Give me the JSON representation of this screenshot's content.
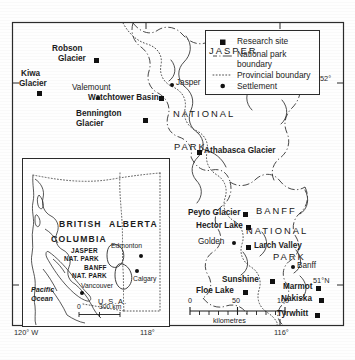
{
  "map": {
    "title": "Canadian Rockies research sites",
    "frame": {
      "left": 12,
      "top": 22,
      "right": 344,
      "bottom": 326
    },
    "colors": {
      "ink": "#1a1a1a",
      "paper": "#fefefe",
      "boundary": "#333333",
      "marker": "#111111"
    }
  },
  "legend": {
    "items": [
      {
        "symbol": "filled-square",
        "label": "Research site"
      },
      {
        "symbol": "dash-dot-line",
        "label": "National park\nboundary",
        "label_line1": "National park",
        "label_line2": "boundary"
      },
      {
        "symbol": "dotted-line",
        "label": "Provincial boundary"
      },
      {
        "symbol": "filled-circle",
        "label": "Settlement"
      }
    ]
  },
  "research_sites": [
    {
      "name": "Robson Glacier",
      "x": 96,
      "y": 60,
      "label_x": 50,
      "label_y": 48,
      "label_lines": [
        "Robson",
        "Glacier"
      ],
      "align": "right"
    },
    {
      "name": "Kiwa Glacier",
      "x": 39,
      "y": 93,
      "label_x": 20,
      "label_y": 74,
      "label_lines": [
        "Kiwa",
        "Glacier"
      ],
      "align": "left"
    },
    {
      "name": "Watchtower Basin",
      "x": 161,
      "y": 98,
      "label_x": 91,
      "label_y": 94,
      "label_lines": [
        "Watchtower Basin"
      ],
      "align": "left"
    },
    {
      "name": "Bennington Glacier",
      "x": 145,
      "y": 120,
      "label_x": 78,
      "label_y": 114,
      "label_lines": [
        "Bennington",
        "Glacier"
      ],
      "align": "left"
    },
    {
      "name": "Athabasca Glacier",
      "x": 199,
      "y": 152,
      "label_x": 205,
      "label_y": 144,
      "label_lines": [
        "Athabasca Glacier"
      ],
      "align": "left"
    },
    {
      "name": "Peyto Glacier",
      "x": 245,
      "y": 214,
      "label_x": 188,
      "label_y": 210,
      "label_lines": [
        "Peyto Glacier"
      ],
      "align": "left"
    },
    {
      "name": "Hector Lake",
      "x": 248,
      "y": 227,
      "label_x": 196,
      "label_y": 223,
      "label_lines": [
        "Hector Lake"
      ],
      "align": "left"
    },
    {
      "name": "Larch Valley",
      "x": 248,
      "y": 247,
      "label_x": 255,
      "label_y": 243,
      "label_lines": [
        "Larch Valley"
      ],
      "align": "left"
    },
    {
      "name": "Sunshine",
      "x": 272,
      "y": 281,
      "label_x": 222,
      "label_y": 277,
      "label_lines": [
        "Sunshine"
      ],
      "align": "left"
    },
    {
      "name": "Floe Lake",
      "x": 245,
      "y": 292,
      "label_x": 196,
      "label_y": 288,
      "label_lines": [
        "Floe Lake"
      ],
      "align": "left"
    },
    {
      "name": "Marmot",
      "x": 318,
      "y": 288,
      "label_x": 283,
      "label_y": 284,
      "label_lines": [
        "Marmot"
      ],
      "align": "left"
    },
    {
      "name": "Nakiska",
      "x": 321,
      "y": 300,
      "label_x": 283,
      "label_y": 296,
      "label_lines": [
        "Nakiska"
      ],
      "align": "left"
    },
    {
      "name": "Tyrwhitt",
      "x": 317,
      "y": 315,
      "label_x": 277,
      "label_y": 311,
      "label_lines": [
        "Tyrwhitt"
      ],
      "align": "left"
    }
  ],
  "settlements": [
    {
      "name": "Valemount",
      "x": 98,
      "y": 98,
      "label_x": 73,
      "label_y": 86
    },
    {
      "name": "Jasper",
      "x": 172,
      "y": 85,
      "label_x": 178,
      "label_y": 79
    },
    {
      "name": "Golden",
      "x": 234,
      "y": 243,
      "label_x": 198,
      "label_y": 239
    },
    {
      "name": "Banff",
      "x": 293,
      "y": 267,
      "label_x": 298,
      "label_y": 265
    }
  ],
  "park_words": [
    {
      "text": "JASPER",
      "x": 209,
      "y": 50
    },
    {
      "text": "NATIONAL",
      "x": 175,
      "y": 113
    },
    {
      "text": "PARK",
      "x": 176,
      "y": 146
    },
    {
      "text": "BANFF",
      "x": 256,
      "y": 210
    },
    {
      "text": "NATIONAL",
      "x": 248,
      "y": 230
    },
    {
      "text": "PARK",
      "x": 275,
      "y": 256
    }
  ],
  "graticule_labels": {
    "right": [
      {
        "text": "52°",
        "x": 321,
        "y": 77
      },
      {
        "text": "51°N",
        "x": 316,
        "y": 279
      }
    ],
    "bottom": [
      {
        "text": "120° W",
        "x": 14,
        "y": 330
      },
      {
        "text": "118°",
        "x": 143,
        "y": 330
      },
      {
        "text": "116°",
        "x": 278,
        "y": 330
      }
    ]
  },
  "scale_bar": {
    "ticks": [
      "0",
      "50",
      "100"
    ],
    "caption": "kilometres",
    "x": 190,
    "y": 306,
    "width": 95
  },
  "inset": {
    "box": {
      "left": 22,
      "top": 158,
      "width": 146,
      "height": 167
    },
    "provinces": [
      {
        "text": "BRITISH",
        "x": 58,
        "y": 225
      },
      {
        "text": "COLUMBIA",
        "x": 50,
        "y": 240
      },
      {
        "text": "ALBERTA",
        "x": 108,
        "y": 225
      }
    ],
    "parks": [
      {
        "lines": [
          "JASPER",
          "NAT. PARK"
        ],
        "x": 70,
        "y": 252
      },
      {
        "lines": [
          "BANFF",
          "NAT. PARK"
        ],
        "x": 83,
        "y": 272
      }
    ],
    "cities": [
      {
        "name": "Edmonton",
        "x": 138,
        "y": 255,
        "label_x": 110,
        "label_y": 245
      },
      {
        "name": "Calgary",
        "x": 133,
        "y": 276,
        "label_x": 133,
        "label_y": 281
      },
      {
        "name": "Vancouver",
        "x": 77,
        "y": 290,
        "label_x": 82,
        "label_y": 284
      }
    ],
    "ocean": {
      "lines": [
        "Pacific",
        "Ocean"
      ],
      "x": 30,
      "y": 290
    },
    "country": {
      "text": "U.S.A.",
      "x": 100,
      "y": 303
    },
    "scale": {
      "zero": "0",
      "value": "300 km",
      "x": 100,
      "y": 313
    }
  }
}
